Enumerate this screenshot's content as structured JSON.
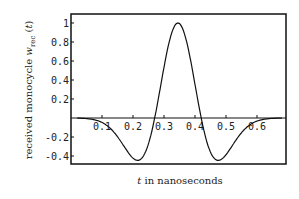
{
  "chart_data": {
    "type": "line",
    "title": "",
    "xlabel": "t in nanoseconds",
    "ylabel": "received monocycle w_rec(t)",
    "xlim": [
      0,
      0.7
    ],
    "ylim": [
      -0.45,
      1.05
    ],
    "xticks": [
      "0.1",
      "0.2",
      "0.3",
      "0.4",
      "0.5",
      "0.6"
    ],
    "yticks": [
      "1",
      "0.8",
      "0.6",
      "0.4",
      "0.2",
      "-0.2",
      "-0.4"
    ],
    "grid": false,
    "legend": null,
    "series": [
      {
        "name": "w_rec(t)",
        "x": [
          0,
          0.05,
          0.1,
          0.15,
          0.2,
          0.21,
          0.25,
          0.27,
          0.3,
          0.345,
          0.39,
          0.42,
          0.45,
          0.48,
          0.5,
          0.55,
          0.6,
          0.65,
          0.7
        ],
        "y": [
          0,
          -0.01,
          -0.06,
          -0.22,
          -0.41,
          -0.43,
          -0.2,
          0.0,
          0.5,
          1.0,
          0.5,
          0.0,
          -0.3,
          -0.43,
          -0.41,
          -0.22,
          -0.06,
          -0.01,
          0
        ]
      }
    ],
    "params": {
      "center": 0.345,
      "tau": 0.266
    }
  }
}
